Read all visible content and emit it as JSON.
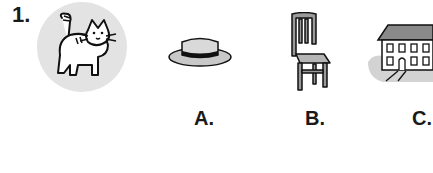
{
  "question": {
    "number": "1.",
    "prompt_image": "cat",
    "options": [
      {
        "label": "A.",
        "image": "hat"
      },
      {
        "label": "B.",
        "image": "chair"
      },
      {
        "label": "C.",
        "image": "house"
      }
    ]
  }
}
